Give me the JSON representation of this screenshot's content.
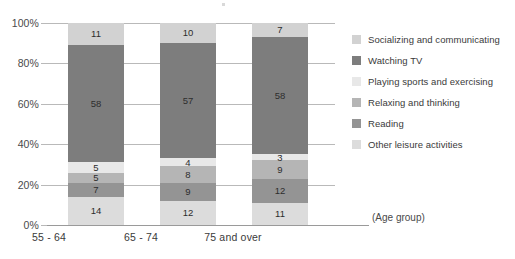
{
  "axis": {
    "y_ticks": [
      "100%",
      "80%",
      "60%",
      "40%",
      "20%",
      "0%"
    ],
    "x_categories": [
      "55 - 64",
      "65 - 74",
      "75 and over"
    ],
    "x_caption": "(Age group)"
  },
  "legend": {
    "items": [
      {
        "label": "Socializing and communicating",
        "color": "#d2d2d2",
        "swatch_name": "legend-swatch-socializing"
      },
      {
        "label": "Watching TV",
        "color": "#7d7d7d",
        "swatch_name": "legend-swatch-watching-tv"
      },
      {
        "label": "Playing sports and exercising",
        "color": "#e8e8e8",
        "swatch_name": "legend-swatch-playing-sports"
      },
      {
        "label": "Relaxing and thinking",
        "color": "#b5b5b5",
        "swatch_name": "legend-swatch-relaxing"
      },
      {
        "label": "Reading",
        "color": "#949494",
        "swatch_name": "legend-swatch-reading"
      },
      {
        "label": "Other leisure activities",
        "color": "#dcdcdc",
        "swatch_name": "legend-swatch-other"
      }
    ]
  },
  "chart_data": {
    "type": "bar",
    "subtype": "stacked-percent",
    "title": "",
    "xlabel": "(Age group)",
    "ylabel": "",
    "ylim": [
      0,
      100
    ],
    "grid": true,
    "legend_position": "right",
    "categories": [
      "55 - 64",
      "65 - 74",
      "75 and over"
    ],
    "stack_order_bottom_to_top": [
      "Other leisure activities",
      "Reading",
      "Relaxing and thinking",
      "Playing sports and exercising",
      "Watching TV",
      "Socializing and communicating"
    ],
    "series": [
      {
        "name": "Socializing and communicating",
        "color": "#d2d2d2",
        "values": [
          11,
          10,
          7
        ]
      },
      {
        "name": "Watching TV",
        "color": "#7d7d7d",
        "values": [
          58,
          57,
          58
        ]
      },
      {
        "name": "Playing sports and exercising",
        "color": "#e8e8e8",
        "values": [
          5,
          4,
          3
        ]
      },
      {
        "name": "Relaxing and thinking",
        "color": "#b5b5b5",
        "values": [
          5,
          8,
          9
        ]
      },
      {
        "name": "Reading",
        "color": "#949494",
        "values": [
          7,
          9,
          12
        ]
      },
      {
        "name": "Other leisure activities",
        "color": "#dcdcdc",
        "values": [
          14,
          12,
          11
        ]
      }
    ],
    "bars": [
      {
        "category": "55 - 64",
        "segments_bottom_to_top": [
          {
            "name": "Other leisure activities",
            "value": 14,
            "color": "#dcdcdc"
          },
          {
            "name": "Reading",
            "value": 7,
            "color": "#949494"
          },
          {
            "name": "Relaxing and thinking",
            "value": 5,
            "color": "#b5b5b5"
          },
          {
            "name": "Playing sports and exercising",
            "value": 5,
            "color": "#e8e8e8"
          },
          {
            "name": "Watching TV",
            "value": 58,
            "color": "#7d7d7d"
          },
          {
            "name": "Socializing and communicating",
            "value": 11,
            "color": "#d2d2d2"
          }
        ]
      },
      {
        "category": "65 - 74",
        "segments_bottom_to_top": [
          {
            "name": "Other leisure activities",
            "value": 12,
            "color": "#dcdcdc"
          },
          {
            "name": "Reading",
            "value": 9,
            "color": "#949494"
          },
          {
            "name": "Relaxing and thinking",
            "value": 8,
            "color": "#b5b5b5"
          },
          {
            "name": "Playing sports and exercising",
            "value": 4,
            "color": "#e8e8e8"
          },
          {
            "name": "Watching TV",
            "value": 57,
            "color": "#7d7d7d"
          },
          {
            "name": "Socializing and communicating",
            "value": 10,
            "color": "#d2d2d2"
          }
        ]
      },
      {
        "category": "75 and over",
        "segments_bottom_to_top": [
          {
            "name": "Other leisure activities",
            "value": 11,
            "color": "#dcdcdc"
          },
          {
            "name": "Reading",
            "value": 12,
            "color": "#949494"
          },
          {
            "name": "Relaxing and thinking",
            "value": 9,
            "color": "#b5b5b5"
          },
          {
            "name": "Playing sports and exercising",
            "value": 3,
            "color": "#e8e8e8"
          },
          {
            "name": "Watching TV",
            "value": 58,
            "color": "#7d7d7d"
          },
          {
            "name": "Socializing and communicating",
            "value": 7,
            "color": "#d2d2d2"
          }
        ]
      }
    ]
  }
}
